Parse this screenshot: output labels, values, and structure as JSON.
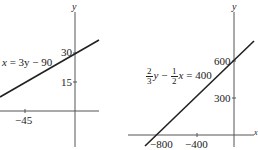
{
  "graphs": [
    {
      "equation": {
        "lhs_var": "x",
        "rhs": "= 3y − 90"
      },
      "axis_y_label": "y",
      "y_ticks": [
        "30",
        "15"
      ],
      "x_ticks": [
        "−45"
      ]
    },
    {
      "equation": {
        "a_num": "2",
        "a_den": "3",
        "var1": "y",
        "op": " − ",
        "b_num": "1",
        "b_den": "2",
        "var2": "x",
        "rhs": " = 400"
      },
      "axis_y_label": "y",
      "axis_x_label": "x",
      "y_ticks": [
        "600",
        "300"
      ],
      "x_ticks": [
        "−800",
        "−400"
      ]
    }
  ],
  "colors": {
    "line": "#222222",
    "axis": "#555555",
    "text": "#222222"
  }
}
